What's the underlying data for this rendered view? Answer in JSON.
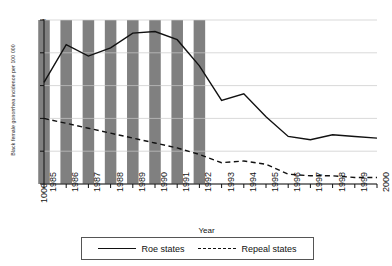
{
  "chart_data": {
    "type": "line",
    "title": "",
    "xlabel": "Year",
    "ylabel": "Black female gonorrhea incidence per 100 000",
    "x": [
      1985,
      1986,
      1987,
      1988,
      1989,
      1990,
      1991,
      1992,
      1993,
      1994,
      1995,
      1996,
      1997,
      1998,
      1999,
      2000
    ],
    "xtick_labels": [
      "1985",
      "1986",
      "1987",
      "1988",
      "1989",
      "1990",
      "1991",
      "1992",
      "1993",
      "1994",
      "1995",
      "1996",
      "1997",
      "1998",
      "1999",
      "2000"
    ],
    "ytick_labels": [
      "1000",
      "2000",
      "3000",
      "4000",
      "5000",
      "6000"
    ],
    "ytick_values": [
      1000,
      2000,
      3000,
      4000,
      5000,
      6000
    ],
    "ylim": [
      1000,
      6000
    ],
    "xlim": [
      1985,
      2000
    ],
    "grid": true,
    "legend_position": "below",
    "series": [
      {
        "name": "Roe states",
        "style": "solid",
        "color": "#111111",
        "values": [
          4100,
          5250,
          4900,
          5150,
          5600,
          5650,
          5400,
          4600,
          3550,
          3750,
          3050,
          2450,
          2350,
          2500,
          2450,
          2400
        ]
      },
      {
        "name": "Repeal states",
        "style": "dashed",
        "color": "#111111",
        "values": [
          3000,
          2850,
          2700,
          2550,
          2400,
          2250,
          2100,
          1900,
          1650,
          1700,
          1600,
          1300,
          1250,
          1250,
          1200,
          1200
        ]
      }
    ],
    "shaded_bands": {
      "label": "shaded-year-bands",
      "color": "#808080",
      "years": [
        1985,
        1986,
        1987,
        1988,
        1989,
        1990,
        1991,
        1992
      ]
    }
  },
  "legend": {
    "items": [
      {
        "label": "Roe states",
        "style": "solid"
      },
      {
        "label": "Repeal states",
        "style": "dashed"
      }
    ]
  }
}
